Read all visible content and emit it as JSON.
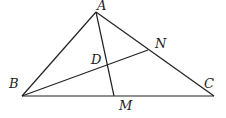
{
  "diagram": {
    "type": "triangle-geometry",
    "points": {
      "A": {
        "label": "A",
        "x": 96,
        "y": 12
      },
      "B": {
        "label": "B",
        "x": 22,
        "y": 96
      },
      "C": {
        "label": "C",
        "x": 214,
        "y": 96
      },
      "M": {
        "label": "M",
        "x": 114,
        "y": 96
      },
      "N": {
        "label": "N",
        "x": 148,
        "y": 50
      },
      "D": {
        "label": "D",
        "x": 107,
        "y": 64
      }
    },
    "segments": [
      "AB",
      "BC",
      "CA",
      "AM",
      "BN"
    ],
    "labels": {
      "A": "A",
      "B": "B",
      "C": "C",
      "D": "D",
      "M": "M",
      "N": "N"
    }
  }
}
